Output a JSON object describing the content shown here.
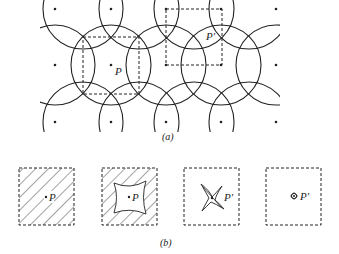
{
  "figure": {
    "panel_a": {
      "caption": "(a)",
      "point_labels": {
        "p": "P",
        "p_prime": "P′"
      },
      "lattice": {
        "dot_columns_x": [
          55,
          111,
          166,
          221,
          276
        ],
        "dot_rows_y": [
          9,
          65,
          122
        ],
        "circle_radius": 40
      },
      "box_p": {
        "x": 83,
        "y": 37,
        "w": 56,
        "h": 57
      },
      "box_p_prime": {
        "x": 166,
        "y": 9,
        "w": 56,
        "h": 56
      }
    },
    "panel_b": {
      "caption": "(b)",
      "boxes": [
        {
          "label": "P",
          "content": "fully hatched square"
        },
        {
          "label": "P",
          "content": "hatched square with curved-square hole"
        },
        {
          "label": "P′",
          "content": "four-pointed star shape"
        },
        {
          "label": "P′",
          "content": "small point mark"
        }
      ]
    },
    "colors": {
      "ink": "#222222",
      "background": "#ffffff"
    }
  }
}
